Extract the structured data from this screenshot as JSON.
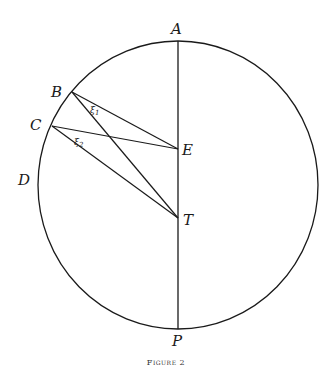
{
  "figure": {
    "caption": "Figure 2",
    "points": {
      "A": {
        "label": "A",
        "x": 178,
        "y": 41
      },
      "B": {
        "label": "B",
        "x": 72,
        "y": 92
      },
      "C": {
        "label": "C",
        "x": 52,
        "y": 126
      },
      "D": {
        "label": "D",
        "x": 40,
        "y": 180
      },
      "E": {
        "label": "E",
        "x": 178,
        "y": 149
      },
      "T": {
        "label": "T",
        "x": 178,
        "y": 218
      },
      "P": {
        "label": "P",
        "x": 178,
        "y": 329
      }
    },
    "angles": {
      "xi1": {
        "label": "ξ",
        "sub": "1"
      },
      "xi2": {
        "label": "ξ",
        "sub": "2"
      }
    },
    "circle": {
      "cx": 178,
      "cy": 185,
      "r": 142
    },
    "line_color": "#1a1a1a"
  }
}
